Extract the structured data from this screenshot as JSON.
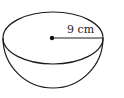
{
  "figure": {
    "shape": "hemisphere",
    "radius_label": "9 cm",
    "stroke_color": "#1a1a1a",
    "background": "#ffffff"
  }
}
